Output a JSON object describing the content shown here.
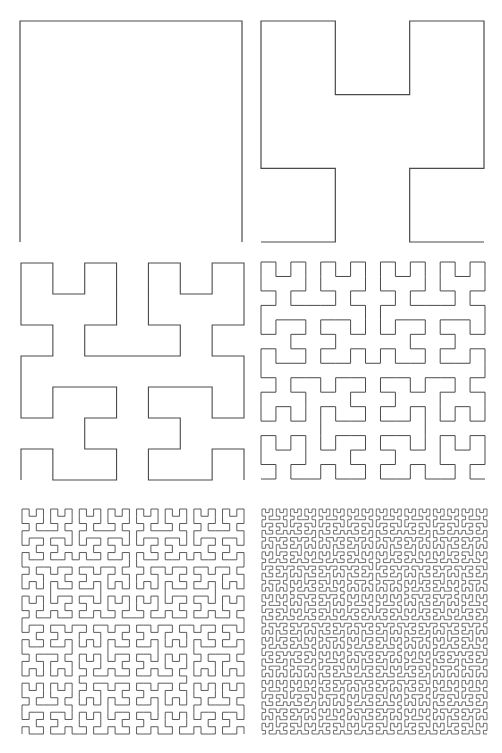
{
  "figure": {
    "title": "Hilbert curve iterations",
    "stroke_color": "#4a4a4a",
    "background": "#ffffff"
  },
  "panels": [
    {
      "order": 1,
      "x": 20,
      "y": 21,
      "width": 222,
      "height": 221,
      "stroke_width": 1.2
    },
    {
      "order": 2,
      "x": 261,
      "y": 21,
      "width": 223,
      "height": 221,
      "stroke_width": 1.2
    },
    {
      "order": 3,
      "x": 21,
      "y": 263,
      "width": 223,
      "height": 217,
      "stroke_width": 1.1
    },
    {
      "order": 4,
      "x": 261,
      "y": 262,
      "width": 224,
      "height": 217,
      "stroke_width": 1.0
    },
    {
      "order": 5,
      "x": 22,
      "y": 509,
      "width": 222,
      "height": 225,
      "stroke_width": 0.9
    },
    {
      "order": 6,
      "x": 262,
      "y": 509,
      "width": 225,
      "height": 225,
      "stroke_width": 0.8
    }
  ]
}
